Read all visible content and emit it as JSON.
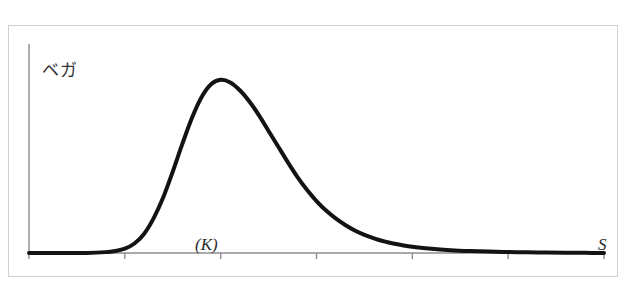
{
  "scan": {
    "top_cut_text": "—  ——  ———  ——  ————  ——  ———  ——  —"
  },
  "figure": {
    "y_axis_label": "ベガ",
    "strike_annotation": "(K)",
    "spot_annotation": "S"
  },
  "chart_data": {
    "type": "line",
    "title": "",
    "subtitle": "",
    "xlabel": "S",
    "ylabel": "ベガ",
    "x_tick_labels": [
      "0",
      "50",
      "100",
      "150",
      "200",
      "250",
      "300"
    ],
    "x_ticks": [
      0,
      50,
      100,
      150,
      200,
      250,
      300
    ],
    "xlim": [
      0,
      300
    ],
    "ylim": [
      0,
      1.08
    ],
    "y_ticks": [],
    "y_tick_labels": [],
    "grid": false,
    "legend": null,
    "annotations": [
      {
        "text": "(K)",
        "x": 100,
        "y": 0.1,
        "style": "italic"
      },
      {
        "text": "S",
        "x": 292,
        "y": 0.1,
        "style": "italic"
      }
    ],
    "series": [
      {
        "name": "ベガ",
        "color": "#131313",
        "line_width": 4,
        "x": [
          0,
          10,
          20,
          30,
          40,
          45,
          50,
          55,
          60,
          65,
          70,
          75,
          80,
          85,
          90,
          95,
          100,
          105,
          110,
          115,
          120,
          125,
          130,
          135,
          140,
          145,
          150,
          155,
          160,
          165,
          170,
          175,
          180,
          185,
          190,
          200,
          210,
          220,
          230,
          240,
          250,
          260,
          270,
          280,
          290,
          300
        ],
        "y": [
          0.0,
          0.0,
          0.0,
          0.0,
          0.005,
          0.012,
          0.025,
          0.055,
          0.11,
          0.2,
          0.32,
          0.47,
          0.63,
          0.78,
          0.9,
          0.975,
          1.0,
          0.985,
          0.94,
          0.875,
          0.795,
          0.705,
          0.615,
          0.525,
          0.44,
          0.365,
          0.3,
          0.245,
          0.2,
          0.162,
          0.13,
          0.105,
          0.085,
          0.068,
          0.055,
          0.036,
          0.024,
          0.016,
          0.011,
          0.008,
          0.006,
          0.004,
          0.003,
          0.002,
          0.001,
          0.0
        ]
      }
    ]
  }
}
